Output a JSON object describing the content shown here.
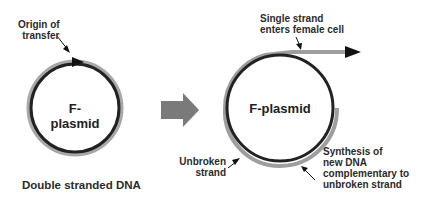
{
  "diagram": {
    "left": {
      "center_label": "F-plasmid",
      "origin_label_line1": "Origin of",
      "origin_label_line2": "transfer",
      "caption": "Double stranded DNA"
    },
    "right": {
      "center_label": "F-plasmid",
      "single_strand_line1": "Single strand",
      "single_strand_line2": "enters female cell",
      "unbroken_line1": "Unbroken",
      "unbroken_line2": "strand",
      "synthesis_line1": "Synthesis of",
      "synthesis_line2": "new DNA",
      "synthesis_line3": "complementary to",
      "synthesis_line4": "unbroken strand"
    },
    "colors": {
      "dark_strand": "#222222",
      "light_strand": "#9a9a9a",
      "transition_arrow": "#7a7a7a"
    }
  }
}
